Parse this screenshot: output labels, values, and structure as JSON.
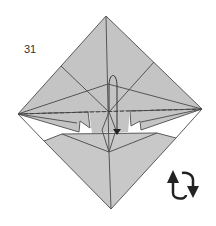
{
  "diagram": {
    "type": "origami-instruction-step",
    "step_number": "31",
    "instruction_symbols": [
      {
        "name": "turn-over-arrows",
        "meaning": "turn the model over"
      },
      {
        "name": "valley-fold-dashed-line",
        "meaning": "fold along the dashed line"
      },
      {
        "name": "fold-arrow",
        "meaning": "fold the flap upward behind"
      }
    ],
    "colors": {
      "paper_fill": "#c4c4c4",
      "lower_flap_fill": "#c8c8c8",
      "crease_line": "#555555",
      "outline": "#555555",
      "arrow": "#222222",
      "background": "#ffffff"
    }
  }
}
